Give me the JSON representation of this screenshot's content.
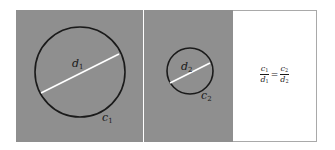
{
  "figure": {
    "panels": [
      {
        "id": "large-circle-panel",
        "background": "#8f8f8f",
        "circle": {
          "cx": 80,
          "cy": 72,
          "r": 45,
          "stroke": "#1a1a1a"
        },
        "diameter": {
          "x1": 41,
          "y1": 93,
          "x2": 119,
          "y2": 54,
          "stroke": "#ffffff"
        },
        "diameter_label": {
          "base": "d",
          "sub": "1"
        },
        "circumference_label": {
          "base": "c",
          "sub": "1"
        }
      },
      {
        "id": "small-circle-panel",
        "background": "#8f8f8f",
        "circle": {
          "cx": 190,
          "cy": 71,
          "r": 23,
          "stroke": "#1a1a1a"
        },
        "diameter": {
          "x1": 170,
          "y1": 83,
          "x2": 210,
          "y2": 63,
          "stroke": "#ffffff"
        },
        "diameter_label": {
          "base": "d",
          "sub": "2"
        },
        "circumference_label": {
          "base": "c",
          "sub": "2"
        }
      },
      {
        "id": "formula-panel",
        "background": "#ffffff",
        "formula": {
          "left": {
            "num_base": "c",
            "num_sub": "1",
            "den_base": "d",
            "den_sub": "1"
          },
          "operator": "=",
          "right": {
            "num_base": "c",
            "num_sub": "2",
            "den_base": "d",
            "den_sub": "2"
          }
        }
      }
    ]
  }
}
